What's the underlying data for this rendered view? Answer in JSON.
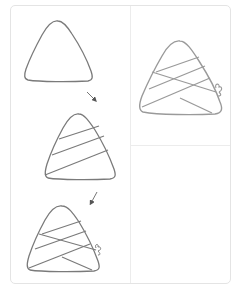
{
  "title": "How to draw a zongzi (rice dumpling)",
  "colors": {
    "stroke": "#7a7a7a",
    "final_stroke": "#9a9a9a",
    "arrow": "#555555",
    "frame_border": "#e4e4e4",
    "divider": "#ececec",
    "background": "#ffffff"
  },
  "steps": [
    {
      "index": 1,
      "label": "Step 1: draw a rounded triangle outline"
    },
    {
      "index": 2,
      "label": "Step 2: add three diagonal wrapping bands"
    },
    {
      "index": 3,
      "label": "Step 3: add crossing bands and the string knot"
    }
  ],
  "final": {
    "label": "Finished zongzi"
  },
  "arrows": [
    {
      "from": "step-1",
      "to": "step-2",
      "direction": "down-right"
    },
    {
      "from": "step-2",
      "to": "step-3",
      "direction": "down-left"
    }
  ]
}
